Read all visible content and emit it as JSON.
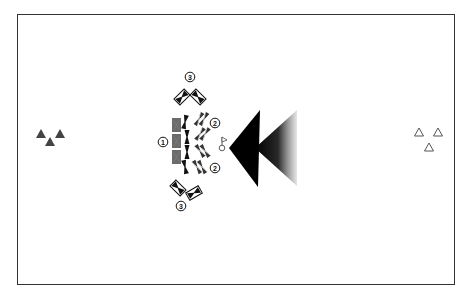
{
  "diagram": {
    "type": "tactical-formation",
    "frame": {
      "border_color": "#333333",
      "background": "#ffffff"
    },
    "left_group": {
      "symbol": "filled-triangle",
      "count": 3,
      "color": "#444444"
    },
    "right_group": {
      "symbol": "outline-triangle",
      "count": 3,
      "color": "#555555"
    },
    "labels": [
      {
        "id": "label-1",
        "text": "1",
        "x": 163,
        "y": 142
      },
      {
        "id": "label-2-top",
        "text": "2",
        "x": 215,
        "y": 123
      },
      {
        "id": "label-2-bottom",
        "text": "2",
        "x": 215,
        "y": 168
      },
      {
        "id": "label-3-top",
        "text": "3",
        "x": 190,
        "y": 77
      },
      {
        "id": "label-3-bottom",
        "text": "3",
        "x": 181,
        "y": 206
      }
    ],
    "arrows": [
      {
        "id": "solid-arrow",
        "direction": "left",
        "style": "solid",
        "color": "#000000"
      },
      {
        "id": "gradient-arrow",
        "direction": "left",
        "style": "gradient",
        "color": "#000000"
      }
    ],
    "flag_marker": {
      "symbol": "flag-on-circle"
    }
  }
}
